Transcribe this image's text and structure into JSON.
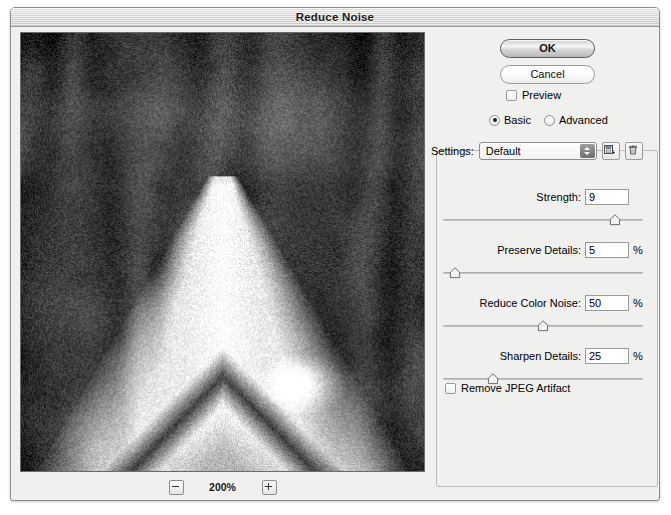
{
  "window": {
    "title": "Reduce Noise"
  },
  "preview": {
    "zoom_level": "200%",
    "zoom_out_icon": "minus-icon",
    "zoom_in_icon": "plus-icon",
    "image_description": "grayscale noisy photo with bright triangular shape"
  },
  "buttons": {
    "ok": "OK",
    "cancel": "Cancel"
  },
  "preview_checkbox": {
    "label": "Preview",
    "checked": false
  },
  "mode": {
    "options": [
      {
        "label": "Basic",
        "selected": true
      },
      {
        "label": "Advanced",
        "selected": false
      }
    ]
  },
  "settings": {
    "label": "Settings:",
    "value": "Default",
    "options": [
      "Default"
    ],
    "save_icon": "save-disk-icon",
    "delete_icon": "trash-icon"
  },
  "controls": [
    {
      "label": "Strength:",
      "value": "9",
      "unit": "",
      "slider_percent": 86,
      "min": 0,
      "max": 10
    },
    {
      "label": "Preserve Details:",
      "value": "5",
      "unit": "%",
      "slider_percent": 6,
      "min": 0,
      "max": 100
    },
    {
      "label": "Reduce Color Noise:",
      "value": "50",
      "unit": "%",
      "slider_percent": 50,
      "min": 0,
      "max": 100
    },
    {
      "label": "Sharpen Details:",
      "value": "25",
      "unit": "%",
      "slider_percent": 25,
      "min": 0,
      "max": 100
    }
  ],
  "jpeg_artifact": {
    "label": "Remove JPEG Artifact",
    "checked": false
  },
  "colors": {
    "window_bg": "#f0f0ee",
    "titlebar": "#e2e2e2",
    "border": "#8d8d8d",
    "text": "#000000"
  }
}
